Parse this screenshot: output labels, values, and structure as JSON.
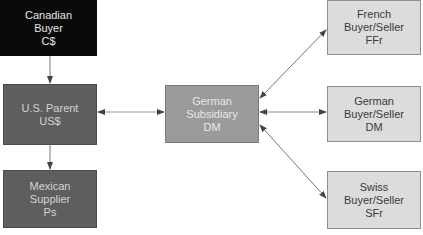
{
  "diagram": {
    "nodes": [
      {
        "id": "canadian-buyer",
        "lines": [
          "Canadian",
          "Buyer",
          "C$"
        ]
      },
      {
        "id": "us-parent",
        "lines": [
          "U.S. Parent",
          "US$"
        ]
      },
      {
        "id": "mexican-supplier",
        "lines": [
          "Mexican",
          "Supplier",
          "Ps"
        ]
      },
      {
        "id": "german-subsidiary",
        "lines": [
          "German",
          "Subsidiary",
          "DM"
        ]
      },
      {
        "id": "french-buyer-seller",
        "lines": [
          "French",
          "Buyer/Seller",
          "FFr"
        ]
      },
      {
        "id": "german-buyer-seller",
        "lines": [
          "German",
          "Buyer/Seller",
          "DM"
        ]
      },
      {
        "id": "swiss-buyer-seller",
        "lines": [
          "Swiss",
          "Buyer/Seller",
          "SFr"
        ]
      }
    ],
    "edges": [
      {
        "from": "canadian-buyer",
        "to": "us-parent",
        "direction": "one-way"
      },
      {
        "from": "us-parent",
        "to": "mexican-supplier",
        "direction": "one-way"
      },
      {
        "from": "us-parent",
        "to": "german-subsidiary",
        "direction": "two-way"
      },
      {
        "from": "german-subsidiary",
        "to": "french-buyer-seller",
        "direction": "two-way"
      },
      {
        "from": "german-subsidiary",
        "to": "german-buyer-seller",
        "direction": "two-way"
      },
      {
        "from": "german-subsidiary",
        "to": "swiss-buyer-seller",
        "direction": "two-way"
      }
    ],
    "colors": {
      "black_box": "#0a0a0a",
      "dark_box": "#5e5e5e",
      "mid_box": "#9a9a9a",
      "light_box": "#dcdcdc",
      "arrow": "#555555"
    }
  }
}
